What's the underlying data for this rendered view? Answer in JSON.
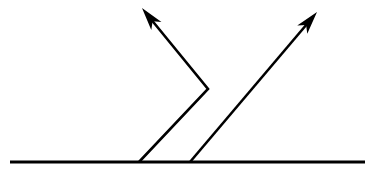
{
  "figure": {
    "background_color": "#ffffff",
    "stroke_color": "#000000",
    "width": 372,
    "height": 176
  },
  "surface": {
    "label": "surface-baseline",
    "x1": 10,
    "y1": 162,
    "x2": 365,
    "y2": 162,
    "thickness": 3.2,
    "color": "#000000"
  },
  "rays": [
    {
      "label": "incident-reflected-ray",
      "type": "polyline",
      "thickness": 2.6,
      "color": "#000000",
      "points": [
        {
          "x": 139,
          "y": 162
        },
        {
          "x": 208,
          "y": 89
        },
        {
          "x": 150,
          "y": 18
        }
      ],
      "arrow": {
        "label": "arrowhead-left",
        "tip_x": 142,
        "tip_y": 8,
        "length": 23,
        "half_width": 6.5,
        "barb_inset": 6,
        "color": "#000000"
      }
    },
    {
      "label": "straight-ray",
      "type": "polyline",
      "thickness": 2.6,
      "color": "#000000",
      "points": [
        {
          "x": 190,
          "y": 162
        },
        {
          "x": 307,
          "y": 24
        }
      ],
      "arrow": {
        "label": "arrowhead-right",
        "tip_x": 317,
        "tip_y": 12,
        "length": 23,
        "half_width": 6.5,
        "barb_inset": 6,
        "color": "#000000"
      }
    }
  ],
  "vertices": [
    {
      "label": "left-ray-foot",
      "x": 139,
      "y": 162
    },
    {
      "label": "bend-vertex",
      "x": 208,
      "y": 89
    },
    {
      "label": "right-ray-foot",
      "x": 190,
      "y": 162
    }
  ],
  "annotations": {
    "text_labels": []
  }
}
